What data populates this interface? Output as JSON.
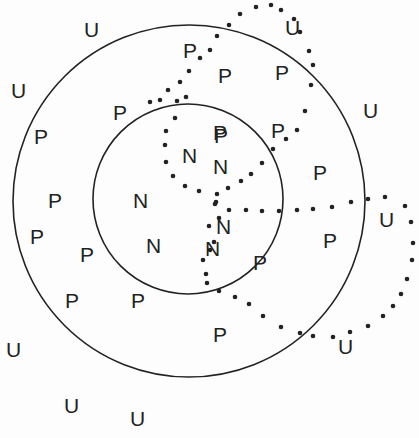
{
  "diagram": {
    "colors": {
      "line": "#222222",
      "text": "#222222",
      "background": "#fdfdfd"
    },
    "circles": [
      {
        "name": "outer-circle",
        "cx": 189,
        "cy": 201,
        "r": 176
      },
      {
        "name": "inner-circle",
        "cx": 188,
        "cy": 199,
        "r": 95
      }
    ],
    "labels": [
      {
        "text": "U",
        "x": 84,
        "y": 37
      },
      {
        "text": "U",
        "x": 11,
        "y": 98
      },
      {
        "text": "U",
        "x": 285,
        "y": 35
      },
      {
        "text": "U",
        "x": 363,
        "y": 118
      },
      {
        "text": "U",
        "x": 379,
        "y": 227
      },
      {
        "text": "U",
        "x": 338,
        "y": 354
      },
      {
        "text": "U",
        "x": 6,
        "y": 357
      },
      {
        "text": "U",
        "x": 64,
        "y": 413
      },
      {
        "text": "U",
        "x": 130,
        "y": 426
      },
      {
        "text": "P",
        "x": 183,
        "y": 58
      },
      {
        "text": "P",
        "x": 113,
        "y": 120
      },
      {
        "text": "P",
        "x": 34,
        "y": 144
      },
      {
        "text": "P",
        "x": 48,
        "y": 208
      },
      {
        "text": "P",
        "x": 30,
        "y": 244
      },
      {
        "text": "P",
        "x": 80,
        "y": 262
      },
      {
        "text": "P",
        "x": 65,
        "y": 308
      },
      {
        "text": "P",
        "x": 131,
        "y": 308
      },
      {
        "text": "P",
        "x": 218,
        "y": 83
      },
      {
        "text": "P",
        "x": 275,
        "y": 80
      },
      {
        "text": "P",
        "x": 271,
        "y": 138
      },
      {
        "text": "P",
        "x": 213,
        "y": 140
      },
      {
        "text": "P",
        "x": 313,
        "y": 180
      },
      {
        "text": "P",
        "x": 323,
        "y": 248
      },
      {
        "text": "P",
        "x": 253,
        "y": 270
      },
      {
        "text": "P",
        "x": 213,
        "y": 342
      },
      {
        "text": "P",
        "x": 214,
        "y": 143
      },
      {
        "text": "N",
        "x": 182,
        "y": 163
      },
      {
        "text": "N",
        "x": 213,
        "y": 174
      },
      {
        "text": "N",
        "x": 133,
        "y": 208
      },
      {
        "text": "N",
        "x": 216,
        "y": 234
      },
      {
        "text": "N",
        "x": 146,
        "y": 253
      },
      {
        "text": "N",
        "x": 205,
        "y": 256
      }
    ],
    "dotted_curves": [
      {
        "name": "upper-dotted-loop",
        "points": [
          [
            177,
            101
          ],
          [
            175,
            118
          ],
          [
            166,
            131
          ],
          [
            165,
            145
          ],
          [
            166,
            162
          ],
          [
            173,
            176
          ],
          [
            185,
            186
          ],
          [
            199,
            191
          ],
          [
            217,
            194
          ],
          [
            216,
            202
          ],
          [
            228,
            188
          ],
          [
            241,
            181
          ],
          [
            251,
            174
          ],
          [
            262,
            163
          ],
          [
            273,
            149
          ],
          [
            286,
            139
          ],
          [
            297,
            130
          ],
          [
            305,
            111
          ],
          [
            311,
            85
          ],
          [
            313,
            65
          ],
          [
            309,
            51
          ],
          [
            300,
            32
          ],
          [
            294,
            19
          ],
          [
            281,
            10
          ],
          [
            271,
            5
          ],
          [
            256,
            7
          ],
          [
            240,
            14
          ],
          [
            229,
            25
          ],
          [
            217,
            36
          ],
          [
            210,
            50
          ],
          [
            200,
            58
          ],
          [
            189,
            71
          ],
          [
            180,
            82
          ],
          [
            168,
            90
          ],
          [
            160,
            100
          ],
          [
            150,
            102
          ],
          [
            186,
            97
          ]
        ]
      },
      {
        "name": "lower-dotted-loop",
        "points": [
          [
            215,
            204
          ],
          [
            229,
            210
          ],
          [
            246,
            210
          ],
          [
            262,
            211
          ],
          [
            279,
            211
          ],
          [
            297,
            210
          ],
          [
            313,
            209
          ],
          [
            332,
            207
          ],
          [
            351,
            202
          ],
          [
            368,
            199
          ],
          [
            385,
            197
          ],
          [
            405,
            206
          ],
          [
            411,
            222
          ],
          [
            413,
            243
          ],
          [
            412,
            260
          ],
          [
            407,
            279
          ],
          [
            401,
            294
          ],
          [
            393,
            306
          ],
          [
            383,
            316
          ],
          [
            368,
            326
          ],
          [
            350,
            332
          ],
          [
            333,
            337
          ],
          [
            313,
            336
          ],
          [
            300,
            333
          ],
          [
            281,
            327
          ],
          [
            263,
            316
          ],
          [
            249,
            304
          ],
          [
            235,
            297
          ],
          [
            219,
            291
          ],
          [
            207,
            283
          ],
          [
            206,
            274
          ],
          [
            203,
            260
          ],
          [
            210,
            250
          ],
          [
            214,
            242
          ],
          [
            209,
            226
          ],
          [
            219,
            218
          ]
        ]
      }
    ]
  }
}
